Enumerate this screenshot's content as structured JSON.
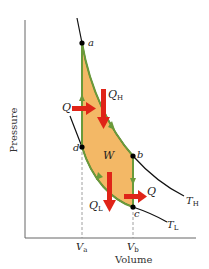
{
  "diagram": {
    "type": "pv-diagram",
    "axes": {
      "x_label": "Volume",
      "y_label": "Pressure",
      "ticks": [
        {
          "main": "V",
          "sub": "a"
        },
        {
          "main": "V",
          "sub": "b"
        }
      ]
    },
    "points": [
      {
        "id": "a",
        "label": "a"
      },
      {
        "id": "b",
        "label": "b"
      },
      {
        "id": "c",
        "label": "c"
      },
      {
        "id": "d",
        "label": "d"
      }
    ],
    "isotherms": [
      {
        "main": "T",
        "sub": "H"
      },
      {
        "main": "T",
        "sub": "L"
      }
    ],
    "heat_labels": {
      "q_in_left": "Q",
      "q_h": {
        "main": "Q",
        "sub": "H"
      },
      "q_l": {
        "main": "Q",
        "sub": "L"
      },
      "q_out_right": "Q"
    },
    "work_label": "W",
    "colors": {
      "fill": "#f3b866",
      "path": "#6a9a3a",
      "arrow": "#e02418",
      "curve": "#111111",
      "axis": "#555555"
    }
  }
}
